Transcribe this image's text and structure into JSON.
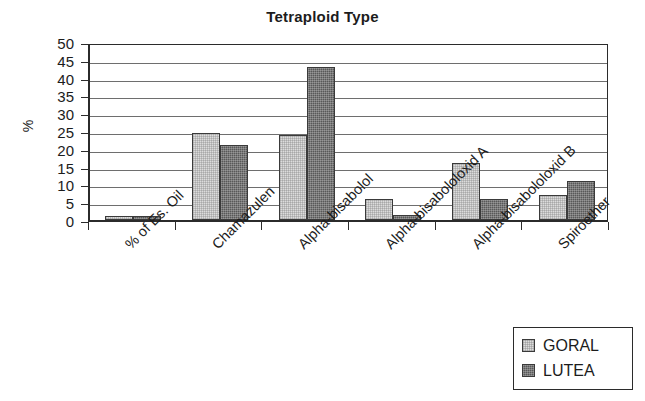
{
  "chart_data": {
    "type": "bar",
    "title": "Tetraploid Type",
    "xlabel": "",
    "ylabel": "%",
    "ylim": [
      0,
      50
    ],
    "ytick_step": 5,
    "yticks": [
      0,
      5,
      10,
      15,
      20,
      25,
      30,
      35,
      40,
      45,
      50
    ],
    "grid": "horizontal",
    "legend_position": "bottom-right",
    "categories": [
      "% of Es. Oil",
      "Chamazulen",
      "Alpha-bisabolol",
      "Alpha-bisabololoxid A",
      "Alpha-bisabololoxid B",
      "Spiroether"
    ],
    "series": [
      {
        "name": "GORAL",
        "color": "#dcdcdc",
        "values": [
          1,
          24.5,
          24,
          6,
          16,
          7
        ]
      },
      {
        "name": "LUTEA",
        "color": "#585858",
        "values": [
          1,
          21,
          43,
          1.5,
          6,
          11
        ]
      }
    ]
  },
  "legend": {
    "entries": [
      {
        "label": "GORAL"
      },
      {
        "label": "LUTEA"
      }
    ]
  }
}
